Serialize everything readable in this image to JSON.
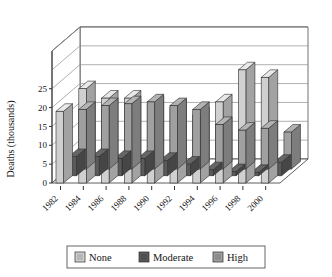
{
  "chart_data": {
    "type": "bar",
    "title": "",
    "subtitle": "",
    "xlabel": "",
    "ylabel": "Deaths (thousands)",
    "categories": [
      "1982",
      "1984",
      "1986",
      "1988",
      "1990",
      "1992",
      "1994",
      "1996",
      "1998",
      "2000"
    ],
    "series": [
      {
        "name": "None",
        "color": "#d0d0d0",
        "values": [
          19.0,
          25.0,
          22.5,
          22.5,
          21.0,
          20.0,
          18.0,
          21.5,
          30.0,
          28.0
        ]
      },
      {
        "name": "Moderate",
        "color": "#5a5a5a",
        "values": [
          7.0,
          7.0,
          6.5,
          6.5,
          6.0,
          5.0,
          3.5,
          3.0,
          2.8,
          5.5
        ]
      },
      {
        "name": "High",
        "color": "#a0a0a0",
        "values": [
          19.5,
          20.5,
          21.0,
          21.5,
          20.5,
          19.5,
          15.5,
          14.0,
          14.5,
          13.5
        ]
      }
    ],
    "ylim": [
      0,
      35
    ],
    "yticks": [
      0,
      5,
      10,
      15,
      20,
      25
    ],
    "ytick_labels": [
      "0",
      "5",
      "10",
      "15",
      "20",
      "25"
    ],
    "grid": true,
    "legend_position": "bottom",
    "projection": "3d",
    "legend_entries": [
      "None",
      "Moderate",
      "High"
    ]
  },
  "legend": {
    "items": [
      {
        "label": "None"
      },
      {
        "label": "Moderate"
      },
      {
        "label": "High"
      }
    ]
  }
}
